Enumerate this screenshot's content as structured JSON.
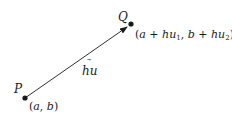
{
  "diagram": {
    "points": {
      "P": {
        "label": "P",
        "coords": "(a, b)",
        "x": 25,
        "y": 98
      },
      "Q": {
        "label": "Q",
        "coords": "(a + hu1, b + hu2)",
        "x": 131,
        "y": 24
      }
    },
    "vector": {
      "label": "hu",
      "has_arrow_over_u": true
    },
    "colors": {
      "ink": "#1a1a1a",
      "background": "#ffffff"
    }
  }
}
